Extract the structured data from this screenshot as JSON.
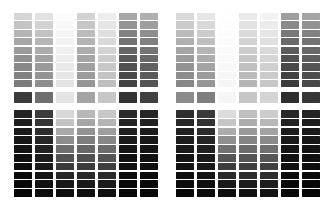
{
  "figure": {
    "kind": "grayscale-step-wedge-grid",
    "background_color": "#ffffff",
    "canvas": {
      "width": 336,
      "height": 208
    }
  },
  "layout": {
    "halves": 2,
    "columns_per_half": 7,
    "upper_block_rows": 9,
    "mid_band_rows": 1,
    "lower_block_rows": 10,
    "half_origins_x": [
      14,
      176
    ],
    "column_pitch_x": 21,
    "column_width": 18,
    "upper_block_top_y": 13,
    "upper_row_pitch_y": 8.4,
    "upper_row_height": 7.2,
    "mid_band_top_y": 92,
    "mid_band_height": 11,
    "lower_block_top_y": 110,
    "lower_row_pitch_y": 8.8,
    "lower_row_height": 7.6,
    "gutter_color": "#ffffff"
  },
  "chart_data": {
    "type": "heatmap",
    "subtitle": "",
    "xlabel": "",
    "ylabel": "",
    "grid": false,
    "legend": "none",
    "value_unit": "hex-gray-level",
    "x": [
      "L1",
      "L2",
      "L3",
      "L4",
      "L5",
      "L6",
      "L7",
      "R1",
      "R2",
      "R3",
      "R4",
      "R5",
      "R6",
      "R7"
    ],
    "blocks": [
      {
        "name": "left-upper-block",
        "half": "left",
        "block": "upper",
        "rows": 9,
        "series": [
          {
            "name": "L1",
            "values": [
              "#d6d6d6",
              "#c4c4c4",
              "#b4b4b4",
              "#a6a6a6",
              "#9a9a9a",
              "#909090",
              "#888888",
              "#808080",
              "#7a7a7a"
            ]
          },
          {
            "name": "L2",
            "values": [
              "#e2e2e2",
              "#d2d2d2",
              "#c2c2c2",
              "#b6b6b6",
              "#ababab",
              "#a2a2a2",
              "#9a9a9a",
              "#949494",
              "#8e8e8e"
            ]
          },
          {
            "name": "L3",
            "values": [
              "#fbfbfb",
              "#f8f8f8",
              "#f5f5f5",
              "#f2f2f2",
              "#efefef",
              "#ececec",
              "#e9e9e9",
              "#e6e6e6",
              "#e3e3e3"
            ]
          },
          {
            "name": "L4",
            "values": [
              "#d2d2d2",
              "#c6c6c6",
              "#bcbcbc",
              "#b4b4b4",
              "#adadad",
              "#a6a6a6",
              "#a0a0a0",
              "#9b9b9b",
              "#969696"
            ]
          },
          {
            "name": "L5",
            "values": [
              "#ededed",
              "#e6e6e6",
              "#dfdfdf",
              "#d9d9d9",
              "#d3d3d3",
              "#cdcdcd",
              "#c8c8c8",
              "#c3c3c3",
              "#bebebe"
            ]
          },
          {
            "name": "L6",
            "values": [
              "#a8a8a8",
              "#949494",
              "#828282",
              "#727272",
              "#656565",
              "#5a5a5a",
              "#515151",
              "#4a4a4a",
              "#444444"
            ]
          },
          {
            "name": "L7",
            "values": [
              "#b0b0b0",
              "#9e9e9e",
              "#8e8e8e",
              "#808080",
              "#747474",
              "#6a6a6a",
              "#616161",
              "#5a5a5a",
              "#545454"
            ]
          }
        ]
      },
      {
        "name": "left-mid-band",
        "half": "left",
        "block": "mid",
        "rows": 1,
        "series": [
          {
            "name": "L1",
            "values": [
              "#3a3a3a"
            ]
          },
          {
            "name": "L2",
            "values": [
              "#6e6e6e"
            ]
          },
          {
            "name": "L3",
            "values": [
              "#e4e4e4"
            ]
          },
          {
            "name": "L4",
            "values": [
              "#a4a4a4"
            ]
          },
          {
            "name": "L5",
            "values": [
              "#c6c6c6"
            ]
          },
          {
            "name": "L6",
            "values": [
              "#343434"
            ]
          },
          {
            "name": "L7",
            "values": [
              "#404040"
            ]
          }
        ]
      },
      {
        "name": "left-lower-block",
        "half": "left",
        "block": "lower",
        "rows": 10,
        "series": [
          {
            "name": "L1",
            "values": [
              "#232323",
              "#1e1e1e",
              "#1a1a1a",
              "#161616",
              "#131313",
              "#101010",
              "#0d0d0d",
              "#0a0a0a",
              "#080808",
              "#060606"
            ]
          },
          {
            "name": "L2",
            "values": [
              "#3c3c3c",
              "#343434",
              "#2d2d2d",
              "#272727",
              "#212121",
              "#1c1c1c",
              "#181818",
              "#141414",
              "#101010",
              "#0d0d0d"
            ]
          },
          {
            "name": "L3",
            "values": [
              "#d8d8d8",
              "#c2c2c2",
              "#a8a8a8",
              "#8c8c8c",
              "#6e6e6e",
              "#525252",
              "#3a3a3a",
              "#272727",
              "#181818",
              "#0e0e0e"
            ]
          },
          {
            "name": "L4",
            "values": [
              "#b8b8b8",
              "#a6a6a6",
              "#939393",
              "#7e7e7e",
              "#676767",
              "#505050",
              "#3b3b3b",
              "#292929",
              "#1a1a1a",
              "#0f0f0f"
            ]
          },
          {
            "name": "L5",
            "values": [
              "#c8c8c8",
              "#b4b4b4",
              "#9e9e9e",
              "#868686",
              "#6c6c6c",
              "#545454",
              "#3e3e3e",
              "#2b2b2b",
              "#1c1c1c",
              "#101010"
            ]
          },
          {
            "name": "L6",
            "values": [
              "#2a2a2a",
              "#242424",
              "#1f1f1f",
              "#1a1a1a",
              "#161616",
              "#121212",
              "#0f0f0f",
              "#0c0c0c",
              "#090909",
              "#070707"
            ]
          },
          {
            "name": "L7",
            "values": [
              "#262626",
              "#212121",
              "#1c1c1c",
              "#181818",
              "#141414",
              "#111111",
              "#0e0e0e",
              "#0b0b0b",
              "#090909",
              "#070707"
            ]
          }
        ]
      },
      {
        "name": "right-upper-block",
        "half": "right",
        "block": "upper",
        "rows": 9,
        "series": [
          {
            "name": "R1",
            "values": [
              "#dadada",
              "#cacaca",
              "#bcbcbc",
              "#b0b0b0",
              "#a5a5a5",
              "#9c9c9c",
              "#949494",
              "#8d8d8d",
              "#878787"
            ]
          },
          {
            "name": "R2",
            "values": [
              "#e6e6e6",
              "#d8d8d8",
              "#cbcbcb",
              "#bfbfbf",
              "#b5b5b5",
              "#ababab",
              "#a3a3a3",
              "#9c9c9c",
              "#969696"
            ]
          },
          {
            "name": "R3",
            "values": [
              "#fefefe",
              "#fdfdfd",
              "#fcfcfc",
              "#fbfbfb",
              "#fafafa",
              "#f9f9f9",
              "#f8f8f8",
              "#f7f7f7",
              "#f6f6f6"
            ]
          },
          {
            "name": "R4",
            "values": [
              "#eaeaea",
              "#e2e2e2",
              "#dadada",
              "#d3d3d3",
              "#cccccc",
              "#c6c6c6",
              "#c0c0c0",
              "#bbbbbb",
              "#b6b6b6"
            ]
          },
          {
            "name": "R5",
            "values": [
              "#f2f2f2",
              "#ececec",
              "#e6e6e6",
              "#e0e0e0",
              "#dadada",
              "#d5d5d5",
              "#d0d0d0",
              "#cbcbcb",
              "#c7c7c7"
            ]
          },
          {
            "name": "R6",
            "values": [
              "#9e9e9e",
              "#8a8a8a",
              "#787878",
              "#696969",
              "#5c5c5c",
              "#515151",
              "#484848",
              "#414141",
              "#3b3b3b"
            ]
          },
          {
            "name": "R7",
            "values": [
              "#a4a4a4",
              "#929292",
              "#828282",
              "#747474",
              "#686868",
              "#5e5e5e",
              "#555555",
              "#4e4e4e",
              "#484848"
            ]
          }
        ]
      },
      {
        "name": "right-mid-band",
        "half": "right",
        "block": "mid",
        "rows": 1,
        "series": [
          {
            "name": "R1",
            "values": [
              "#8a8a8a"
            ]
          },
          {
            "name": "R2",
            "values": [
              "#7e7e7e"
            ]
          },
          {
            "name": "R3",
            "values": [
              "#f6f6f6"
            ]
          },
          {
            "name": "R4",
            "values": [
              "#c6c6c6"
            ]
          },
          {
            "name": "R5",
            "values": [
              "#d4d4d4"
            ]
          },
          {
            "name": "R6",
            "values": [
              "#2e2e2e"
            ]
          },
          {
            "name": "R7",
            "values": [
              "#363636"
            ]
          }
        ]
      },
      {
        "name": "right-lower-block",
        "half": "right",
        "block": "lower",
        "rows": 10,
        "series": [
          {
            "name": "R1",
            "values": [
              "#2e2e2e",
              "#282828",
              "#222222",
              "#1d1d1d",
              "#191919",
              "#151515",
              "#111111",
              "#0e0e0e",
              "#0b0b0b",
              "#080808"
            ]
          },
          {
            "name": "R2",
            "values": [
              "#3a3a3a",
              "#333333",
              "#2c2c2c",
              "#262626",
              "#202020",
              "#1b1b1b",
              "#171717",
              "#131313",
              "#0f0f0f",
              "#0c0c0c"
            ]
          },
          {
            "name": "R3",
            "values": [
              "#dcdcdc",
              "#c6c6c6",
              "#acacac",
              "#8f8f8f",
              "#717171",
              "#555555",
              "#3d3d3d",
              "#292929",
              "#1a1a1a",
              "#0f0f0f"
            ]
          },
          {
            "name": "R4",
            "values": [
              "#bfbfbf",
              "#adadad",
              "#999999",
              "#848484",
              "#6c6c6c",
              "#555555",
              "#3f3f3f",
              "#2c2c2c",
              "#1d1d1d",
              "#111111"
            ]
          },
          {
            "name": "R5",
            "values": [
              "#cccccc",
              "#b8b8b8",
              "#a2a2a2",
              "#8a8a8a",
              "#707070",
              "#575757",
              "#414141",
              "#2d2d2d",
              "#1e1e1e",
              "#121212"
            ]
          },
          {
            "name": "R6",
            "values": [
              "#272727",
              "#222222",
              "#1d1d1d",
              "#191919",
              "#151515",
              "#121212",
              "#0e0e0e",
              "#0b0b0b",
              "#090909",
              "#070707"
            ]
          },
          {
            "name": "R7",
            "values": [
              "#242424",
              "#1f1f1f",
              "#1b1b1b",
              "#171717",
              "#131313",
              "#101010",
              "#0d0d0d",
              "#0a0a0a",
              "#080808",
              "#060606"
            ]
          }
        ]
      }
    ]
  }
}
